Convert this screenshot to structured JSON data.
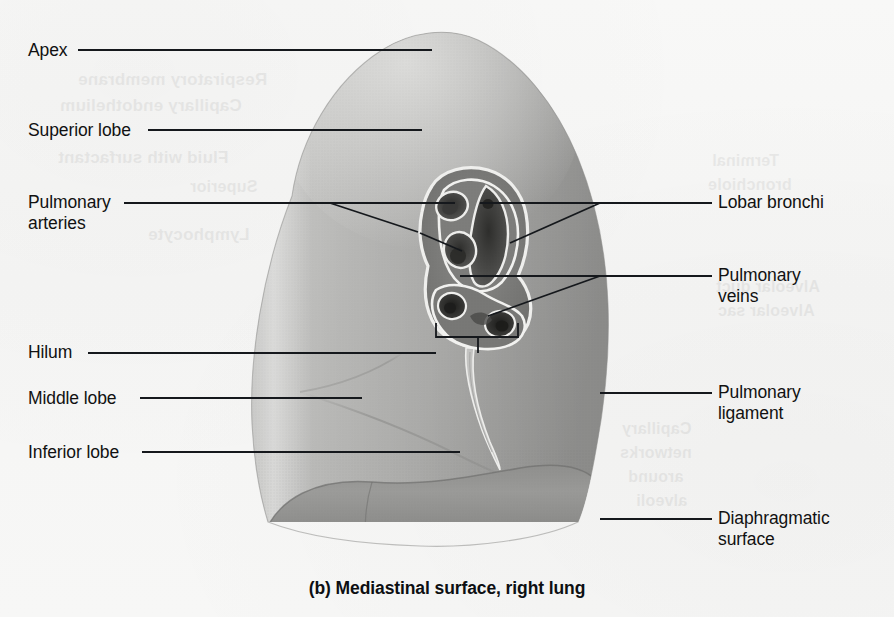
{
  "figure": {
    "caption": "(b) Mediastinal surface, right lung",
    "background_color": "#f7f7f6",
    "ink_color": "#15181c"
  },
  "labels_left": [
    {
      "id": "apex",
      "text": "Apex",
      "x": 28,
      "y": 40,
      "line": {
        "x1": 78,
        "y1": 50,
        "x2": 432,
        "y2": 50
      }
    },
    {
      "id": "superior-lobe",
      "text": "Superior lobe",
      "x": 28,
      "y": 120,
      "line": {
        "x1": 148,
        "y1": 130,
        "x2": 422,
        "y2": 130
      }
    },
    {
      "id": "pulmonary-arteries",
      "text": "Pulmonary\narteries",
      "x": 28,
      "y": 192,
      "line": {
        "x1": 124,
        "y1": 203,
        "x2": 455,
        "y2": 203
      }
    },
    {
      "id": "hilum",
      "text": "Hilum",
      "x": 28,
      "y": 342,
      "line": {
        "x1": 88,
        "y1": 353,
        "x2": 436,
        "y2": 353
      }
    },
    {
      "id": "middle-lobe",
      "text": "Middle lobe",
      "x": 28,
      "y": 388,
      "line": {
        "x1": 140,
        "y1": 398,
        "x2": 362,
        "y2": 398
      }
    },
    {
      "id": "inferior-lobe",
      "text": "Inferior lobe",
      "x": 28,
      "y": 442,
      "line": {
        "x1": 142,
        "y1": 452,
        "x2": 460,
        "y2": 452
      }
    }
  ],
  "labels_right": [
    {
      "id": "lobar-bronchi",
      "text": "Lobar bronchi",
      "x": 718,
      "y": 192,
      "line": {
        "x1": 600,
        "y1": 203,
        "x2": 712,
        "y2": 203
      }
    },
    {
      "id": "pulmonary-veins",
      "text": "Pulmonary\nveins",
      "x": 718,
      "y": 265,
      "line": {
        "x1": 600,
        "y1": 276,
        "x2": 712,
        "y2": 276
      }
    },
    {
      "id": "pulmonary-ligament",
      "text": "Pulmonary\nligament",
      "x": 718,
      "y": 382,
      "line": {
        "x1": 600,
        "y1": 393,
        "x2": 712,
        "y2": 393
      }
    },
    {
      "id": "diaphragmatic-surface",
      "text": "Diaphragmatic\nsurface",
      "x": 718,
      "y": 508,
      "line": {
        "x1": 600,
        "y1": 519,
        "x2": 712,
        "y2": 519
      }
    }
  ],
  "bleed_through": [
    {
      "text": "Respiratory membrane",
      "x": 78,
      "y": 70,
      "size": 17,
      "bold": true
    },
    {
      "text": "Capillary endothelium",
      "x": 60,
      "y": 96,
      "size": 17,
      "bold": true
    },
    {
      "text": "Fluid with surfactant",
      "x": 58,
      "y": 148,
      "size": 17,
      "bold": true
    },
    {
      "text": "Lymphocyte",
      "x": 148,
      "y": 225,
      "size": 17,
      "bold": true
    },
    {
      "text": "Superior",
      "x": 190,
      "y": 178,
      "size": 16,
      "bold": true
    },
    {
      "text": "Terminal",
      "x": 712,
      "y": 152,
      "size": 16,
      "bold": true
    },
    {
      "text": "bronchiole",
      "x": 708,
      "y": 176,
      "size": 16,
      "bold": true
    },
    {
      "text": "Alveolar duct",
      "x": 716,
      "y": 278,
      "size": 16,
      "bold": true
    },
    {
      "text": "Alveolar sac",
      "x": 718,
      "y": 302,
      "size": 16,
      "bold": true
    },
    {
      "text": "Capillary",
      "x": 622,
      "y": 420,
      "size": 16,
      "bold": true
    },
    {
      "text": "networks",
      "x": 620,
      "y": 444,
      "size": 16,
      "bold": true
    },
    {
      "text": "around",
      "x": 628,
      "y": 468,
      "size": 16,
      "bold": true
    },
    {
      "text": "alveoli",
      "x": 636,
      "y": 492,
      "size": 16,
      "bold": true
    }
  ],
  "annotations": {
    "hilum_bracket": {
      "left": 436,
      "right": 518,
      "top": 337,
      "stem_x": 478,
      "stem_bottom": 353
    },
    "artery_fork": [
      {
        "x1": 330,
        "y1": 203,
        "x2": 418,
        "y2": 232
      },
      {
        "x1": 420,
        "y1": 233,
        "x2": 462,
        "y2": 251
      }
    ],
    "bronchi_fork": [
      {
        "x1": 600,
        "y1": 203,
        "x2": 480,
        "y2": 203
      },
      {
        "x1": 600,
        "y1": 203,
        "x2": 510,
        "y2": 243
      }
    ],
    "vein_fork": [
      {
        "x1": 600,
        "y1": 276,
        "x2": 460,
        "y2": 276
      },
      {
        "x1": 600,
        "y1": 276,
        "x2": 488,
        "y2": 316
      }
    ]
  },
  "anatomy_parts": [
    {
      "id": "apex",
      "name": "Apex"
    },
    {
      "id": "superior-lobe",
      "name": "Superior lobe"
    },
    {
      "id": "middle-lobe",
      "name": "Middle lobe"
    },
    {
      "id": "inferior-lobe",
      "name": "Inferior lobe"
    },
    {
      "id": "hilum",
      "name": "Hilum"
    },
    {
      "id": "pulmonary-arteries",
      "name": "Pulmonary arteries"
    },
    {
      "id": "pulmonary-veins",
      "name": "Pulmonary veins"
    },
    {
      "id": "lobar-bronchi",
      "name": "Lobar bronchi"
    },
    {
      "id": "pulmonary-ligament",
      "name": "Pulmonary ligament"
    },
    {
      "id": "diaphragmatic-surface",
      "name": "Diaphragmatic surface"
    }
  ]
}
